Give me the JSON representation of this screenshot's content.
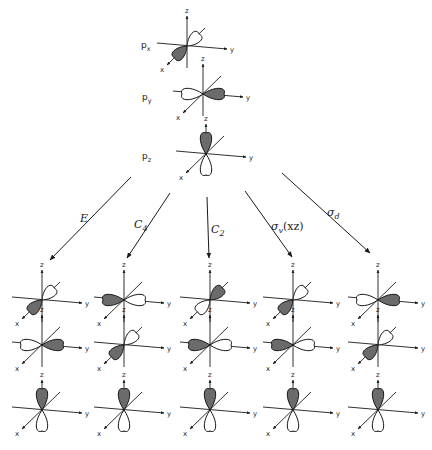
{
  "figure": {
    "colors": {
      "ink": "#1a1a1a",
      "shade": "#6b6b6b",
      "background": "#ffffff"
    },
    "axis_labels": {
      "x": "x",
      "y": "y",
      "z": "z"
    },
    "source_orbitals": [
      {
        "label": "px",
        "label_main": "p",
        "label_sub": "x",
        "orientation": "x",
        "cx": 187,
        "cy": 46,
        "label_x": 141,
        "label_y": 48
      },
      {
        "label": "py",
        "label_main": "p",
        "label_sub": "y",
        "orientation": "y",
        "cx": 203,
        "cy": 94,
        "label_x": 142,
        "label_y": 100
      },
      {
        "label": "pz",
        "label_main": "p",
        "label_sub": "z",
        "orientation": "z",
        "cx": 206,
        "cy": 154,
        "label_x": 142,
        "label_y": 159
      }
    ],
    "operations": [
      {
        "label": "E",
        "label_main": "E",
        "label_sub": "",
        "arrow": [
          131,
          177,
          50,
          260
        ],
        "label_x": 80,
        "label_y": 222
      },
      {
        "label": "C4",
        "label_main": "C",
        "label_sub": "4",
        "arrow": [
          170,
          193,
          127,
          258
        ],
        "label_x": 134,
        "label_y": 228
      },
      {
        "label": "C2",
        "label_main": "C",
        "label_sub": "2",
        "arrow": [
          207,
          197,
          209,
          258
        ],
        "label_x": 211,
        "label_y": 233
      },
      {
        "label": "σv(xz)",
        "label_main": "σ",
        "label_sub": "v",
        "label_suffix": "(xz)",
        "arrow": [
          245,
          191,
          292,
          257
        ],
        "label_x": 271,
        "label_y": 230
      },
      {
        "label": "σd",
        "label_main": "σ",
        "label_sub": "d",
        "arrow": [
          282,
          173,
          370,
          253
        ],
        "label_x": 327,
        "label_y": 216
      }
    ],
    "result_columns": [
      {
        "operation": "E",
        "cx": 42,
        "rows": [
          "x",
          "y",
          "z"
        ]
      },
      {
        "operation": "C4",
        "cx": 124,
        "rows": [
          "-y",
          "x",
          "z"
        ]
      },
      {
        "operation": "C2",
        "cx": 210,
        "rows": [
          "-x",
          "-y",
          "z"
        ]
      },
      {
        "operation": "σv(xz)",
        "cx": 293,
        "rows": [
          "x",
          "-y",
          "z"
        ]
      },
      {
        "operation": "σd",
        "cx": 378,
        "rows": [
          "y",
          "x",
          "z"
        ]
      }
    ],
    "result_row_y": [
      300,
      345,
      410
    ]
  }
}
